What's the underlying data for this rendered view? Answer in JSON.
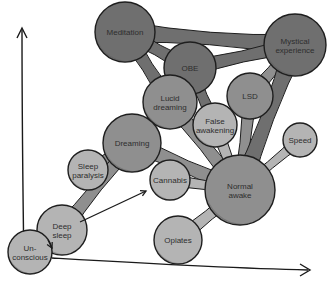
{
  "diagram": {
    "type": "bubble-network",
    "axes": {
      "y_axis": {
        "label": "",
        "direction": "up"
      },
      "x_axis": {
        "label": "",
        "direction": "right"
      }
    },
    "colors": {
      "dark": "#6f6f6f",
      "medium": "#8f8f8f",
      "light": "#b4b4b4",
      "outline": "#1e1e1e",
      "shade": "#5a5a5a"
    },
    "nodes": [
      {
        "id": "meditation",
        "lines": [
          "Meditation"
        ],
        "x": 125,
        "y": 32,
        "r": 30,
        "tone": "dark"
      },
      {
        "id": "mystical",
        "lines": [
          "Mystical",
          "experience"
        ],
        "x": 295,
        "y": 45,
        "r": 31,
        "tone": "dark"
      },
      {
        "id": "obe",
        "lines": [
          "OBE"
        ],
        "x": 190,
        "y": 68,
        "r": 26,
        "tone": "dark"
      },
      {
        "id": "lsd",
        "lines": [
          "LSD"
        ],
        "x": 250,
        "y": 96,
        "r": 23,
        "tone": "medium"
      },
      {
        "id": "lucid",
        "lines": [
          "Lucid",
          "dreaming"
        ],
        "x": 170,
        "y": 102,
        "r": 27,
        "tone": "medium"
      },
      {
        "id": "false-awakening",
        "lines": [
          "False",
          "awakening"
        ],
        "x": 215,
        "y": 125,
        "r": 22,
        "tone": "light"
      },
      {
        "id": "speed",
        "lines": [
          "Speed"
        ],
        "x": 300,
        "y": 140,
        "r": 17,
        "tone": "light"
      },
      {
        "id": "dreaming",
        "lines": [
          "Dreaming"
        ],
        "x": 132,
        "y": 143,
        "r": 29,
        "tone": "medium"
      },
      {
        "id": "sleep-paralysis",
        "lines": [
          "Sleep",
          "paralysis"
        ],
        "x": 88,
        "y": 170,
        "r": 20,
        "tone": "light"
      },
      {
        "id": "cannabis",
        "lines": [
          "Cannabis"
        ],
        "x": 170,
        "y": 180,
        "r": 20,
        "tone": "light"
      },
      {
        "id": "normal-awake",
        "lines": [
          "Normal",
          "awake"
        ],
        "x": 240,
        "y": 190,
        "r": 35,
        "tone": "medium"
      },
      {
        "id": "opiates",
        "lines": [
          "Opiates"
        ],
        "x": 178,
        "y": 240,
        "r": 24,
        "tone": "light"
      },
      {
        "id": "deep-sleep",
        "lines": [
          "Deep",
          "sleep"
        ],
        "x": 62,
        "y": 230,
        "r": 25,
        "tone": "light"
      },
      {
        "id": "unconscious",
        "lines": [
          "Un-",
          "conscious"
        ],
        "x": 30,
        "y": 252,
        "r": 22,
        "tone": "light"
      }
    ],
    "links": [
      [
        "meditation",
        "mystical"
      ],
      [
        "meditation",
        "obe"
      ],
      [
        "meditation",
        "lucid"
      ],
      [
        "obe",
        "mystical"
      ],
      [
        "lsd",
        "mystical"
      ],
      [
        "obe",
        "lucid"
      ],
      [
        "obe",
        "false-awakening"
      ],
      [
        "lucid",
        "dreaming"
      ],
      [
        "lucid",
        "normal-awake"
      ],
      [
        "dreaming",
        "sleep-paralysis"
      ],
      [
        "dreaming",
        "deep-sleep"
      ],
      [
        "dreaming",
        "normal-awake"
      ],
      [
        "false-awakening",
        "normal-awake"
      ],
      [
        "lsd",
        "normal-awake"
      ],
      [
        "speed",
        "normal-awake"
      ],
      [
        "cannabis",
        "normal-awake"
      ],
      [
        "opiates",
        "normal-awake"
      ],
      [
        "deep-sleep",
        "unconscious"
      ],
      [
        "mystical",
        "normal-awake"
      ]
    ],
    "arrows": [
      {
        "id": "deep-sleep-to-cannabis",
        "from": [
          80,
          222
        ],
        "to": [
          146,
          191
        ]
      },
      {
        "id": "unconscious-to-deep-sleep",
        "from": [
          48,
          240
        ],
        "to": [
          52,
          248
        ]
      }
    ]
  }
}
